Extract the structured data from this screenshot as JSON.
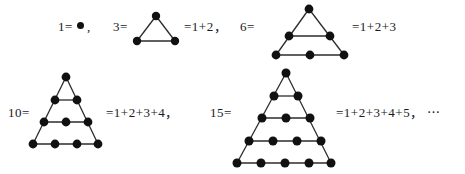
{
  "figure": {
    "dot_color": "#111111",
    "line_color": "#2b2b2b",
    "background": "#ffffff",
    "text_color": "#1a1a1a"
  },
  "rows": [
    {
      "row_id": "row-1",
      "items": [
        {
          "item_id": "item-1",
          "lhs": "1=",
          "dot_inline": "●",
          "trailing": ",",
          "rhs": "",
          "figure_type": "single-dot",
          "rows_of_dots": 1,
          "dot_count": 1
        },
        {
          "item_id": "item-3",
          "lhs": "3=",
          "dot_inline": "",
          "trailing": ",",
          "rhs": "=1+2",
          "figure_type": "triangle",
          "rows_of_dots": 2,
          "dot_count": 3
        },
        {
          "item_id": "item-6",
          "lhs": "6=",
          "dot_inline": "",
          "trailing": "",
          "rhs": "=1+2+3",
          "figure_type": "triangle",
          "rows_of_dots": 3,
          "dot_count": 6
        }
      ]
    },
    {
      "row_id": "row-2",
      "items": [
        {
          "item_id": "item-10",
          "lhs": "10=",
          "dot_inline": "",
          "trailing": ",",
          "rhs": "=1+2+3+4",
          "figure_type": "triangle",
          "rows_of_dots": 4,
          "dot_count": 10
        },
        {
          "item_id": "item-15",
          "lhs": "15=",
          "dot_inline": "",
          "trailing": ",",
          "rhs": "=1+2+3+4+5",
          "figure_type": "triangle",
          "rows_of_dots": 5,
          "dot_count": 15,
          "ellipsis": "⋯"
        }
      ]
    }
  ],
  "labels": {
    "l1": "1=",
    "l1_dot": "●",
    "l1_comma": ",",
    "l3": "3=",
    "r3": "=1+2，",
    "l6": "6=",
    "r6": "=1+2+3",
    "l10": "10=",
    "r10": "=1+2+3+4，",
    "l15": "15=",
    "r15": "=1+2+3+4+5， ⋯"
  }
}
